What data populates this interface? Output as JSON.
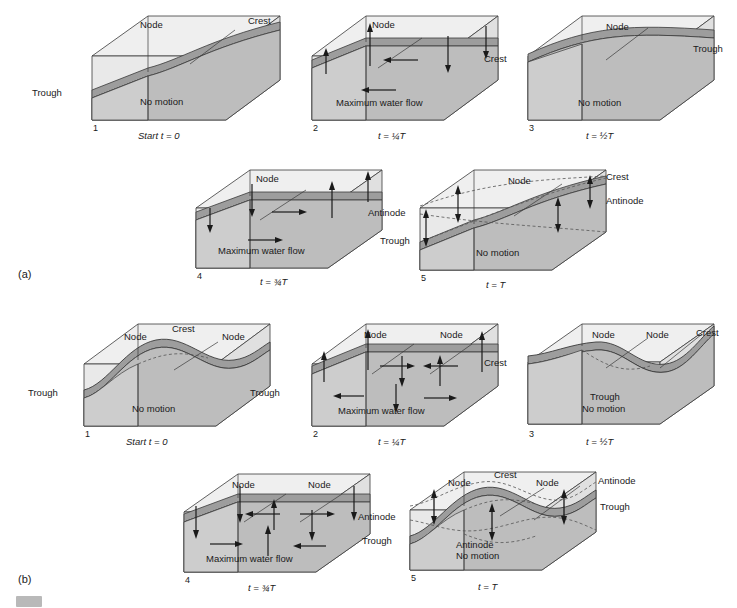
{
  "figure": {
    "sections": [
      {
        "id": "a",
        "label": "(a)",
        "mode": "single-node seiche (fundamental)"
      },
      {
        "id": "b",
        "label": "(b)",
        "mode": "two-node seiche (first overtone)"
      }
    ]
  },
  "colors": {
    "box_light": "#e9e9e9",
    "box_top_face": "#efefef",
    "water_body": "#bdbdbd",
    "water_side": "#cdcdcd",
    "wave_surface": "#9d9d9d",
    "wave_surface_dark": "#8f8f8f",
    "outline": "#3a3a3a",
    "dashed": "#555555",
    "background": "#ffffff"
  },
  "labels": {
    "node": "Node",
    "crest": "Crest",
    "trough": "Trough",
    "antinode": "Antinode",
    "no_motion": "No motion",
    "max_flow": "Maximum water flow",
    "start": "Start t = 0"
  },
  "times": {
    "t0": "Start t = 0",
    "t1": "t = ¼T",
    "t2": "t = ½T",
    "t3": "t = ¾T",
    "t4": "t = T"
  },
  "section_a": {
    "label": "(a)",
    "panels": [
      {
        "number": "1",
        "time": "Start t = 0",
        "state": "no motion",
        "state_text": "No motion",
        "nodes": 1,
        "callouts": [
          {
            "text": "Node",
            "pos": "top-center"
          },
          {
            "text": "Crest",
            "pos": "top-right"
          },
          {
            "text": "Trough",
            "pos": "left"
          }
        ]
      },
      {
        "number": "2",
        "time": "t = ¼T",
        "state": "maximum water flow",
        "state_text": "Maximum water flow",
        "nodes": 1,
        "flow_direction": "left",
        "callouts": [
          {
            "text": "Node",
            "pos": "top-center"
          }
        ]
      },
      {
        "number": "3",
        "time": "t = ½T",
        "state": "no motion",
        "state_text": "No motion",
        "nodes": 1,
        "callouts": [
          {
            "text": "Node",
            "pos": "top-center"
          },
          {
            "text": "Trough",
            "pos": "right"
          },
          {
            "text": "Crest",
            "pos": "left"
          }
        ]
      },
      {
        "number": "4",
        "time": "t = ¾T",
        "state": "maximum water flow",
        "state_text": "Maximum water flow",
        "nodes": 1,
        "flow_direction": "right",
        "callouts": [
          {
            "text": "Node",
            "pos": "top-center"
          }
        ]
      },
      {
        "number": "5",
        "time": "t = T",
        "state": "no motion",
        "state_text": "No motion",
        "nodes": 1,
        "envelope": true,
        "callouts": [
          {
            "text": "Node",
            "pos": "top-center"
          },
          {
            "text": "Crest",
            "pos": "top-right"
          },
          {
            "text": "Antinode",
            "pos": "right"
          },
          {
            "text": "Antinode",
            "pos": "left"
          },
          {
            "text": "Trough",
            "pos": "left-lower"
          }
        ]
      }
    ]
  },
  "section_b": {
    "label": "(b)",
    "panels": [
      {
        "number": "1",
        "time": "Start t = 0",
        "state": "no motion",
        "state_text": "No motion",
        "nodes": 2,
        "callouts": [
          {
            "text": "Node",
            "pos": "top-left"
          },
          {
            "text": "Crest",
            "pos": "top-center"
          },
          {
            "text": "Node",
            "pos": "top-right"
          },
          {
            "text": "Trough",
            "pos": "left"
          },
          {
            "text": "Trough",
            "pos": "right"
          }
        ]
      },
      {
        "number": "2",
        "time": "t = ¼T",
        "state": "maximum water flow",
        "state_text": "Maximum water flow",
        "nodes": 2,
        "flow_direction": "converging-down",
        "callouts": [
          {
            "text": "Node",
            "pos": "top-left"
          },
          {
            "text": "Node",
            "pos": "top-right"
          }
        ]
      },
      {
        "number": "3",
        "time": "t = ½T",
        "state": "no motion",
        "state_text": "No motion",
        "nodes": 2,
        "callouts": [
          {
            "text": "Node",
            "pos": "top-left"
          },
          {
            "text": "Node",
            "pos": "top-right"
          },
          {
            "text": "Crest",
            "pos": "top-right-outer"
          },
          {
            "text": "Crest",
            "pos": "left"
          },
          {
            "text": "Trough",
            "pos": "center"
          }
        ]
      },
      {
        "number": "4",
        "time": "t = ¾T",
        "state": "maximum water flow",
        "state_text": "Maximum water flow",
        "nodes": 2,
        "flow_direction": "diverging-up",
        "callouts": [
          {
            "text": "Node",
            "pos": "top-left"
          },
          {
            "text": "Node",
            "pos": "top-right"
          }
        ]
      },
      {
        "number": "5",
        "time": "t = T",
        "state": "no motion",
        "state_text": "No motion",
        "nodes": 2,
        "envelope": true,
        "callouts": [
          {
            "text": "Node",
            "pos": "top-left"
          },
          {
            "text": "Crest",
            "pos": "top-center"
          },
          {
            "text": "Node",
            "pos": "top-right"
          },
          {
            "text": "Antinode",
            "pos": "top-right-outer"
          },
          {
            "text": "Trough",
            "pos": "right"
          },
          {
            "text": "Antinode",
            "pos": "left"
          },
          {
            "text": "Trough",
            "pos": "left-lower"
          },
          {
            "text": "Antinode",
            "pos": "center-bottom"
          }
        ]
      }
    ]
  }
}
